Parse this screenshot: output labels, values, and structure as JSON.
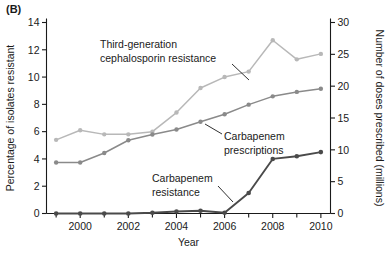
{
  "figure": {
    "panel_label": "(B)",
    "xlabel": "Year",
    "ylabel_left": "Percentage of isolates resistant",
    "ylabel_right": "Number of doses prescribed (millions)"
  },
  "annotations": {
    "ceph_line1": "Third-generation",
    "ceph_line2": "cephalosporin resistance",
    "presc_line1": "Carbapenem",
    "presc_line2": "prescriptions",
    "carb_line1": "Carbapenem",
    "carb_line2": "resistance"
  },
  "colors": {
    "cephalosporin": "#b8b8b8",
    "prescriptions": "#8a8a8a",
    "carbapenem": "#4a4a4a",
    "axis": "#1a1a1a",
    "background": "#ffffff"
  },
  "axes": {
    "x_ticks_major": [
      "2000",
      "2002",
      "2004",
      "2006",
      "2008",
      "2010"
    ],
    "x_ticks_major_values": [
      2000,
      2002,
      2004,
      2006,
      2008,
      2010
    ],
    "x_ticks_minor_values": [
      1999,
      2001,
      2003,
      2005,
      2007,
      2009
    ],
    "x_range": [
      1998.6,
      2010.4
    ],
    "y_left_ticks": [
      "0",
      "2",
      "4",
      "6",
      "8",
      "10",
      "12",
      "14"
    ],
    "y_left_values": [
      0,
      2,
      4,
      6,
      8,
      10,
      12,
      14
    ],
    "y_left_range": [
      0,
      14
    ],
    "y_right_ticks": [
      "0",
      "5",
      "10",
      "15",
      "20",
      "25",
      "30"
    ],
    "y_right_values": [
      0,
      5,
      10,
      15,
      20,
      25,
      30
    ],
    "y_right_range": [
      0,
      30
    ]
  },
  "chart_data": {
    "type": "line",
    "title": "",
    "xlabel": "Year",
    "ylabel": "Percentage of isolates resistant",
    "ylabel_secondary": "Number of doses prescribed (millions)",
    "x": [
      1999,
      2000,
      2001,
      2002,
      2003,
      2004,
      2005,
      2006,
      2007,
      2008,
      2009,
      2010
    ],
    "xlim": [
      1998.6,
      2010.4
    ],
    "ylim": [
      0,
      14
    ],
    "ylim_secondary": [
      0,
      30
    ],
    "grid": false,
    "legend": "inline-annotations",
    "series": [
      {
        "name": "Third-generation cephalosporin resistance",
        "axis": "left",
        "unit": "percent",
        "color": "#b8b8b8",
        "marker": "circle",
        "values": [
          5.4,
          6.1,
          5.8,
          5.8,
          6.0,
          7.4,
          9.2,
          10.0,
          10.4,
          12.7,
          11.3,
          11.7
        ]
      },
      {
        "name": "Carbapenem prescriptions",
        "axis": "right",
        "unit": "millions of doses",
        "color": "#8a8a8a",
        "marker": "circle",
        "values": [
          8.0,
          8.0,
          9.5,
          11.5,
          12.4,
          13.2,
          14.4,
          15.6,
          17.1,
          18.4,
          19.1,
          19.6
        ]
      },
      {
        "name": "Carbapenem resistance",
        "axis": "left",
        "unit": "percent",
        "color": "#4a4a4a",
        "marker": "circle",
        "values": [
          0.0,
          0.0,
          0.0,
          0.0,
          0.05,
          0.15,
          0.2,
          0.05,
          1.5,
          4.0,
          4.2,
          4.5
        ]
      }
    ]
  }
}
